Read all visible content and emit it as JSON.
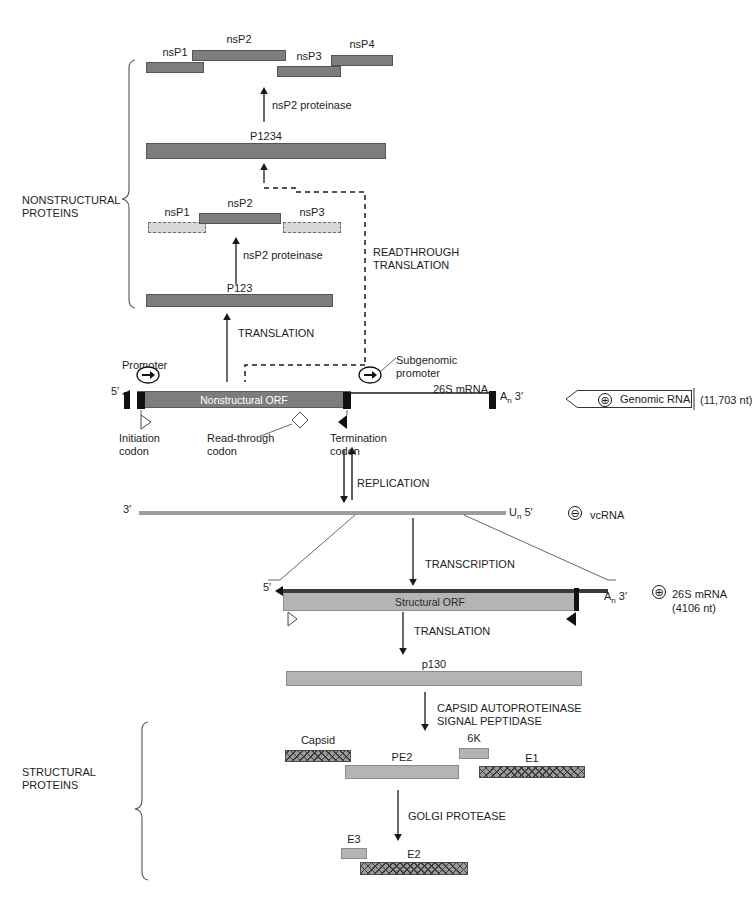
{
  "figure": {
    "groups": {
      "nonstructural": "NONSTRUCTURAL\nPROTEINS",
      "structural": "STRUCTURAL\nPROTEINS"
    }
  },
  "nonstructural": {
    "cleaved_products": [
      {
        "label": "nsP1"
      },
      {
        "label": "nsP2"
      },
      {
        "label": "nsP3"
      },
      {
        "label": "nsP4"
      }
    ],
    "p1234": "P1234",
    "p123": "P123",
    "proteinase_top": "nsP2 proteinase",
    "proteinase_mid": "nsP2 proteinase",
    "p123_products": [
      {
        "label": "nsP1"
      },
      {
        "label": "nsP2"
      },
      {
        "label": "nsP3"
      }
    ],
    "readthrough": "READTHROUGH\nTRANSLATION",
    "translation": "TRANSLATION"
  },
  "genome": {
    "promoter": "Promoter",
    "subgenomic_promoter": "Subgenomic\npromoter",
    "five_prime": "5′",
    "three_prime": "3′",
    "polyA": "A",
    "polyA_sub": "n",
    "orf_label": "Nonstructural ORF",
    "mrna_26s": "26S mRNA",
    "initiation_codon": "Initiation\ncodon",
    "readthrough_codon": "Read-through\ncodon",
    "termination_codon": "Termination\ncodon",
    "rna_badge": "Genomic RNA",
    "rna_polarity": "⊕",
    "rna_length": "(11,703 nt)"
  },
  "replication": {
    "label": "REPLICATION",
    "vcrna_three_prime": "3′",
    "vcrna_five_prime": "5′",
    "vcrna_polyU": "U",
    "vcrna_polyU_sub": "n",
    "vcrna_polarity": "⊖",
    "vcrna_label": "vcRNA",
    "transcription": "TRANSCRIPTION"
  },
  "subgenomic": {
    "five_prime": "5′",
    "three_prime": "3′",
    "polyA": "A",
    "polyA_sub": "n",
    "orf_label": "Structural ORF",
    "polarity": "⊕",
    "badge": "26S mRNA",
    "length": "(4106 nt)",
    "translation": "TRANSLATION"
  },
  "structural": {
    "polyprotein": "p130",
    "processing": "CAPSID AUTOPROTEINASE\nSIGNAL PEPTIDASE",
    "products": [
      {
        "label": "Capsid"
      },
      {
        "label": "PE2"
      },
      {
        "label": "6K"
      },
      {
        "label": "E1"
      }
    ],
    "golgi": "GOLGI PROTEASE",
    "final": [
      {
        "label": "E3"
      },
      {
        "label": "E2"
      }
    ]
  },
  "colors": {
    "solid_protein": "#7d7d7d",
    "light_protein": "#b4b4b4",
    "dashed_protein": "#d7d7d7",
    "hatched_protein": "#9a9a9a",
    "line": "#1a1a1a"
  }
}
